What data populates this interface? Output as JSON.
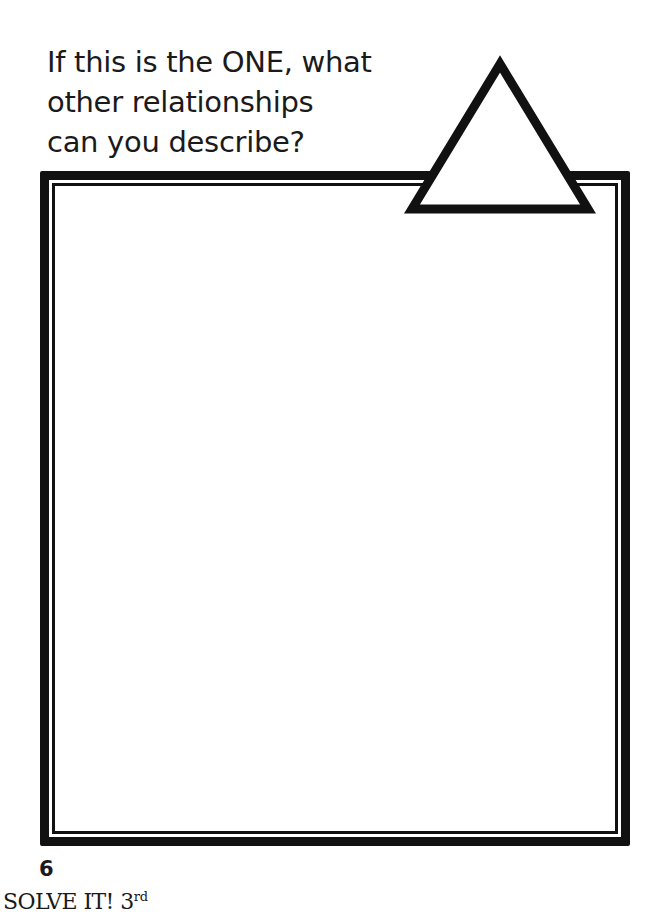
{
  "prompt": {
    "lines": [
      "If this is the ONE, what",
      "other relationships",
      "can you describe?"
    ]
  },
  "shape": {
    "icon": "triangle-outline",
    "stroke_color": "#111111",
    "fill_color": "#ffffff"
  },
  "answer_box": {
    "border_color": "#111111",
    "style": "double-border"
  },
  "footer": {
    "page_number": "6",
    "book_title": "SOLVE IT! 3",
    "grade_suffix": "rd"
  }
}
